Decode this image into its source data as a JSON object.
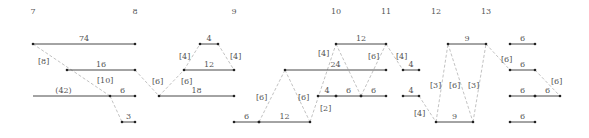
{
  "diagram": {
    "type": "scheduling-gantt-network",
    "columns": [
      {
        "label": "7",
        "x": 33
      },
      {
        "label": "8",
        "x": 135
      },
      {
        "label": "9",
        "x": 234
      },
      {
        "label": "10",
        "x": 336
      },
      {
        "label": "11",
        "x": 386
      },
      {
        "label": "12",
        "x": 436
      },
      {
        "label": "13",
        "x": 486
      }
    ],
    "bars": [
      {
        "id": "b1",
        "x1": 33,
        "x2": 135,
        "y": 44,
        "label": "74"
      },
      {
        "id": "b2",
        "x1": 67,
        "x2": 135,
        "y": 70,
        "label": "16"
      },
      {
        "id": "b3",
        "x1": 110,
        "x2": 135,
        "y": 96,
        "label": "6"
      },
      {
        "id": "b4",
        "x1": 122,
        "x2": 135,
        "y": 122,
        "label": "3"
      },
      {
        "id": "b5",
        "x1": 159,
        "x2": 234,
        "y": 96,
        "label": "18"
      },
      {
        "id": "b6",
        "x1": 184,
        "x2": 234,
        "y": 70,
        "label": "12"
      },
      {
        "id": "b7",
        "x1": 200,
        "x2": 218,
        "y": 44,
        "label": "4"
      },
      {
        "id": "b8",
        "x1": 234,
        "x2": 259,
        "y": 122,
        "label": "6"
      },
      {
        "id": "b9",
        "x1": 259,
        "x2": 310,
        "y": 122,
        "label": "12"
      },
      {
        "id": "b10",
        "x1": 285,
        "x2": 386,
        "y": 70,
        "label": "24"
      },
      {
        "id": "b11",
        "x1": 336,
        "x2": 386,
        "y": 44,
        "label": "12"
      },
      {
        "id": "b12",
        "x1": 318,
        "x2": 336,
        "y": 96,
        "label": "4"
      },
      {
        "id": "b13",
        "x1": 336,
        "x2": 361,
        "y": 96,
        "label": "6"
      },
      {
        "id": "b14",
        "x1": 361,
        "x2": 386,
        "y": 96,
        "label": "6"
      },
      {
        "id": "b15",
        "x1": 403,
        "x2": 419,
        "y": 70,
        "label": "4"
      },
      {
        "id": "b16",
        "x1": 403,
        "x2": 419,
        "y": 96,
        "label": "4"
      },
      {
        "id": "b17",
        "x1": 448,
        "x2": 486,
        "y": 44,
        "label": "9"
      },
      {
        "id": "b18",
        "x1": 436,
        "x2": 473,
        "y": 122,
        "label": "9"
      },
      {
        "id": "b19",
        "x1": 510,
        "x2": 535,
        "y": 44,
        "label": "6"
      },
      {
        "id": "b20",
        "x1": 510,
        "x2": 535,
        "y": 70,
        "label": "6"
      },
      {
        "id": "b21",
        "x1": 510,
        "x2": 535,
        "y": 96,
        "label": "6"
      },
      {
        "id": "b22",
        "x1": 535,
        "x2": 560,
        "y": 96,
        "label": "6"
      },
      {
        "id": "b23",
        "x1": 510,
        "x2": 535,
        "y": 122,
        "label": "6"
      }
    ],
    "solid_line": {
      "x1": 33,
      "x2": 110,
      "y": 96,
      "label": "(42)"
    },
    "dashed_links": [
      {
        "x1": 33,
        "y1": 44,
        "x2": 110,
        "y2": 96,
        "label": "[8]",
        "lx": 38,
        "ly": 64
      },
      {
        "x1": 110,
        "y1": 96,
        "x2": 122,
        "y2": 122,
        "label": "[10]",
        "lx": 97,
        "ly": 83
      },
      {
        "x1": 135,
        "y1": 70,
        "x2": 159,
        "y2": 96,
        "label": "[6]",
        "lx": 152,
        "ly": 84
      },
      {
        "x1": 159,
        "y1": 96,
        "x2": 184,
        "y2": 70,
        "label": "[6]",
        "lx": 181,
        "ly": 84
      },
      {
        "x1": 184,
        "y1": 70,
        "x2": 200,
        "y2": 44,
        "label": "[4]",
        "lx": 179,
        "ly": 59
      },
      {
        "x1": 218,
        "y1": 44,
        "x2": 234,
        "y2": 70,
        "label": "[4]",
        "lx": 230,
        "ly": 59
      },
      {
        "x1": 259,
        "y1": 122,
        "x2": 285,
        "y2": 70,
        "label": "[6]",
        "lx": 256,
        "ly": 100
      },
      {
        "x1": 285,
        "y1": 70,
        "x2": 310,
        "y2": 122,
        "label": "[6]",
        "lx": 298,
        "ly": 100
      },
      {
        "x1": 310,
        "y1": 122,
        "x2": 336,
        "y2": 44,
        "label": "[2]",
        "lx": 320,
        "ly": 111
      },
      {
        "x1": 336,
        "y1": 44,
        "x2": 361,
        "y2": 96,
        "label": "[4]",
        "lx": 318,
        "ly": 56
      },
      {
        "x1": 361,
        "y1": 96,
        "x2": 386,
        "y2": 44,
        "label": "[6]",
        "lx": 368,
        "ly": 59
      },
      {
        "x1": 386,
        "y1": 44,
        "x2": 403,
        "y2": 70,
        "label": "[4]",
        "lx": 396,
        "ly": 59
      },
      {
        "x1": 419,
        "y1": 96,
        "x2": 436,
        "y2": 122,
        "label": "[4]",
        "lx": 414,
        "ly": 116
      },
      {
        "x1": 436,
        "y1": 122,
        "x2": 448,
        "y2": 44,
        "label": "[3]",
        "lx": 430,
        "ly": 88
      },
      {
        "x1": 448,
        "y1": 44,
        "x2": 473,
        "y2": 122,
        "label": "[6]",
        "lx": 449,
        "ly": 88
      },
      {
        "x1": 473,
        "y1": 122,
        "x2": 486,
        "y2": 44,
        "label": "[3]",
        "lx": 468,
        "ly": 88
      },
      {
        "x1": 486,
        "y1": 44,
        "x2": 510,
        "y2": 70,
        "label": "[6]",
        "lx": 501,
        "ly": 62
      },
      {
        "x1": 535,
        "y1": 70,
        "x2": 560,
        "y2": 96,
        "label": "[6]",
        "lx": 551,
        "ly": 84
      }
    ]
  }
}
